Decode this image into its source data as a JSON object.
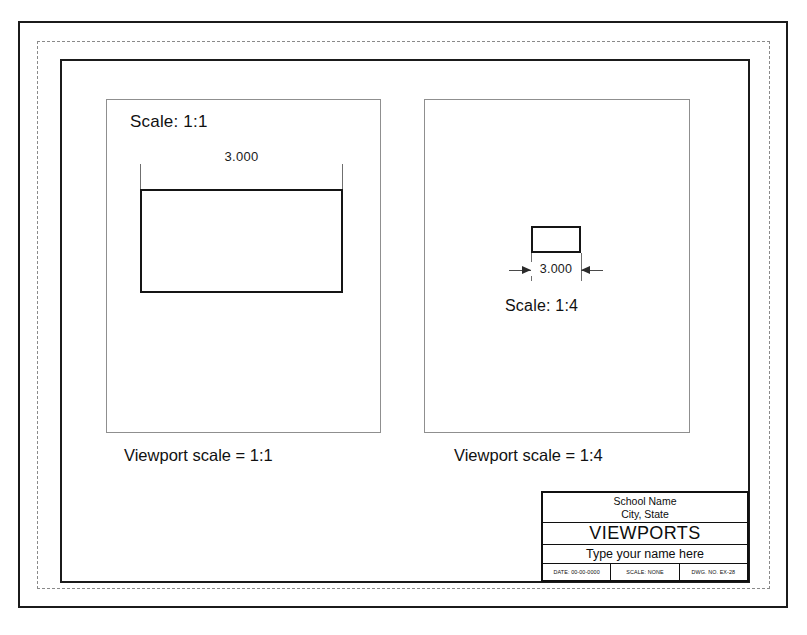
{
  "sheet": {
    "border_color": "#1b1b1b",
    "dashed_border_color": "#8a8a8a",
    "background": "#ffffff"
  },
  "viewports": [
    {
      "id": "left",
      "scale_label": "Scale: 1:1",
      "dimension_value": "3.000",
      "caption": "Viewport scale = 1:1"
    },
    {
      "id": "right",
      "scale_label": "Scale: 1:4",
      "dimension_value": "3.000",
      "caption": "Viewport scale = 1:4"
    }
  ],
  "title_block": {
    "school_name": "School Name",
    "city_state": "City, State",
    "drawing_title": "VIEWPORTS",
    "name_prompt": "Type your name here",
    "date_cell": "DATE: 00-00-0000",
    "scale_cell": "SCALE: NONE",
    "dwg_cell": "DWG. NO. EX-28"
  }
}
